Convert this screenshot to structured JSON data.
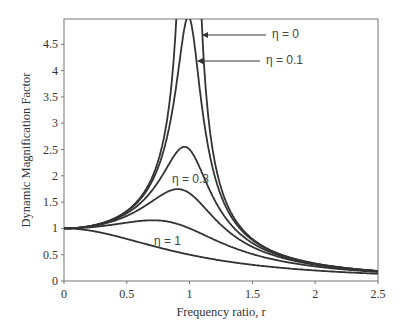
{
  "chart_data": {
    "type": "line",
    "title": "",
    "xlabel": "Frequency ratio, r",
    "ylabel": "Dynamic Magnification Factor",
    "xlim": [
      0,
      2.5
    ],
    "ylim": [
      0,
      5
    ],
    "xticks": [
      0,
      0.5,
      1,
      1.5,
      2,
      2.5
    ],
    "xtick_labels": [
      "0",
      "0.5",
      "1",
      "1.5",
      "2",
      "2.5"
    ],
    "yticks": [
      0,
      0.5,
      1,
      1.5,
      2,
      2.5,
      3,
      3.5,
      4,
      4.5
    ],
    "ytick_labels": [
      "0",
      "0.5",
      "1",
      "1.5",
      "2",
      "2.5",
      "3",
      "3.5",
      "4",
      "4.5"
    ],
    "grid": false,
    "legend": "none (inline annotations)",
    "formula": "DMF = 1 / sqrt((1 - r^2)^2 + (2*eta*r)^2)",
    "series": [
      {
        "name": "η = 0",
        "eta": 0,
        "peak": "unbounded at r = 1",
        "x": [
          0,
          0.5,
          0.8,
          0.9,
          0.95,
          1.05,
          1.1,
          1.2,
          1.5,
          2,
          2.5
        ],
        "y": [
          1.0,
          1.33,
          2.78,
          5.26,
          10.26,
          9.76,
          4.76,
          2.27,
          0.8,
          0.33,
          0.19
        ]
      },
      {
        "name": "η = 0.1",
        "eta": 0.1,
        "peak": 5.03,
        "x": [
          0,
          0.5,
          0.8,
          0.9,
          1.0,
          1.1,
          1.2,
          1.5,
          2,
          2.5
        ],
        "y": [
          1.0,
          1.33,
          2.6,
          3.6,
          5.0,
          3.5,
          2.1,
          0.79,
          0.33,
          0.19
        ]
      },
      {
        "name": "η = 0.2",
        "eta": 0.2,
        "peak": 2.55,
        "x": [
          0,
          0.5,
          0.8,
          0.96,
          1.1,
          1.2,
          1.5,
          2,
          2.5
        ],
        "y": [
          1.0,
          1.29,
          2.11,
          2.55,
          2.03,
          1.57,
          0.75,
          0.32,
          0.19
        ]
      },
      {
        "name": "η = 0.3",
        "eta": 0.3,
        "peak": 1.75,
        "x": [
          0,
          0.5,
          0.8,
          0.9,
          1.1,
          1.5,
          2,
          2.5
        ],
        "y": [
          1.0,
          1.23,
          1.64,
          1.72,
          1.39,
          0.7,
          0.31,
          0.18
        ]
      },
      {
        "name": "η = 0.5",
        "eta": 0.5,
        "peak": 1.15,
        "x": [
          0,
          0.5,
          0.71,
          1.0,
          1.5,
          2,
          2.5
        ],
        "y": [
          1.0,
          1.11,
          1.15,
          1.0,
          0.55,
          0.28,
          0.17
        ]
      },
      {
        "name": "η = 1",
        "eta": 1,
        "peak": 1.0,
        "x": [
          0,
          0.5,
          1.0,
          1.5,
          2,
          2.5
        ],
        "y": [
          1.0,
          0.8,
          0.5,
          0.31,
          0.2,
          0.14
        ]
      }
    ],
    "annotations": [
      {
        "text": "η = 0",
        "x_px": 272,
        "y_px": 38,
        "arrow_to_px": [
          203,
          35
        ]
      },
      {
        "text": "η = 0.1",
        "x_px": 266,
        "y_px": 64,
        "arrow_to_px": [
          198,
          61
        ]
      },
      {
        "text": "η = 0.3",
        "x_px": 172,
        "y_px": 183
      },
      {
        "text": "η = 1",
        "x_px": 154,
        "y_px": 245
      }
    ]
  }
}
